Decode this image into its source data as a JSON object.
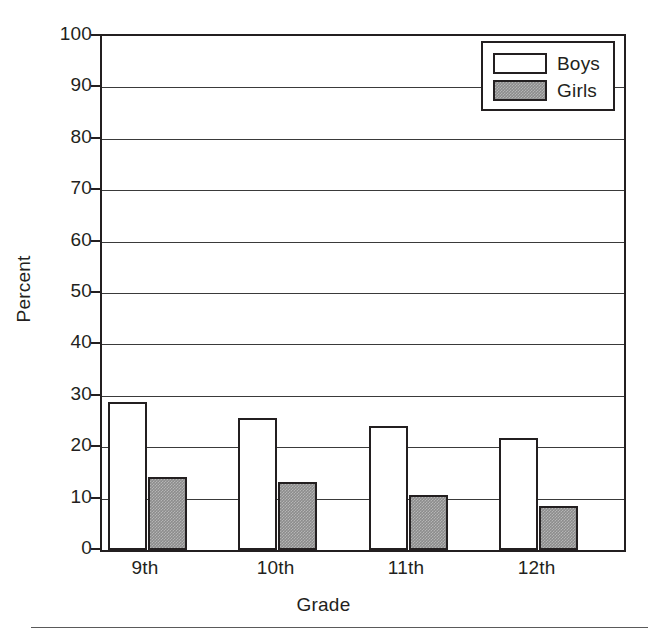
{
  "chart_data": {
    "type": "bar",
    "title": "",
    "subtitle": "",
    "xlabel": "Grade",
    "ylabel": "Percent",
    "categories": [
      "9th",
      "10th",
      "11th",
      "12th"
    ],
    "series": [
      {
        "name": "Boys",
        "values": [
          28.8,
          25.6,
          24.1,
          21.7
        ],
        "fill": "#ffffff",
        "edge": "#231f20"
      },
      {
        "name": "Girls",
        "values": [
          14.2,
          13.2,
          10.8,
          8.5
        ],
        "fill": "#8c8c8c",
        "edge": "#231f20"
      }
    ],
    "ylim": [
      0,
      100
    ],
    "ytick_step": 10,
    "yticks": [
      "100",
      "90",
      "80",
      "70",
      "60",
      "50",
      "40",
      "30",
      "20",
      "10",
      "0"
    ],
    "grid": true,
    "grid_axis": "y",
    "legend_position": "upper right",
    "legend_entries": [
      "Boys",
      "Girls"
    ]
  },
  "legend": {
    "boys_label": "Boys",
    "girls_label": "Girls"
  },
  "axes": {
    "y_title": "Percent",
    "x_title": "Grade"
  }
}
